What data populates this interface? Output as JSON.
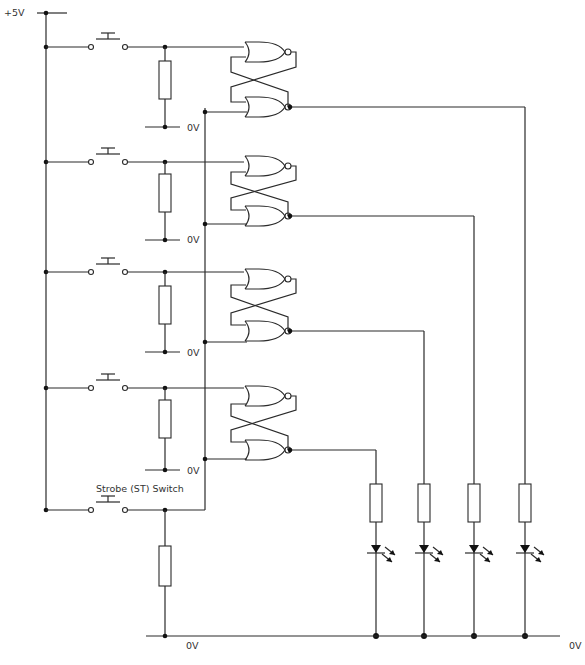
{
  "labels": {
    "supply": "+5V",
    "ground": "0V",
    "strobe_switch": "Strobe (ST) Switch"
  },
  "colors": {
    "wire": "#2a2a2a",
    "background": "#ffffff"
  },
  "rows": [
    {
      "id": "row-1",
      "component": "push-switch",
      "pulldown_label": "0V",
      "latch": "nor-sr-latch",
      "output_led": 4
    },
    {
      "id": "row-2",
      "component": "push-switch",
      "pulldown_label": "0V",
      "latch": "nor-sr-latch",
      "output_led": 3
    },
    {
      "id": "row-3",
      "component": "push-switch",
      "pulldown_label": "0V",
      "latch": "nor-sr-latch",
      "output_led": 2
    },
    {
      "id": "row-4",
      "component": "push-switch",
      "pulldown_label": "0V",
      "latch": "nor-sr-latch",
      "output_led": 1
    }
  ],
  "leds": [
    {
      "id": "led-1",
      "series_resistor": true
    },
    {
      "id": "led-2",
      "series_resistor": true
    },
    {
      "id": "led-3",
      "series_resistor": true
    },
    {
      "id": "led-4",
      "series_resistor": true
    }
  ]
}
